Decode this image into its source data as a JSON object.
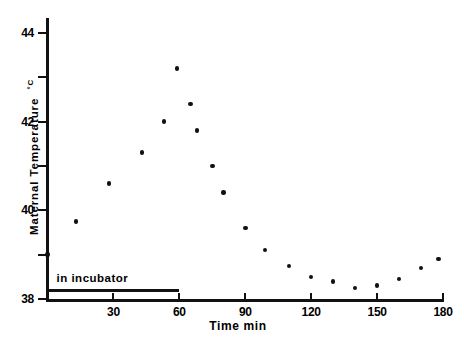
{
  "chart_data": {
    "type": "scatter",
    "title": "",
    "xlabel": "Time  min",
    "ylabel": "Maternal Temperature  °C",
    "ylabel_text": "Maternal Temperature",
    "ylabel_unit": "°C",
    "xlim": [
      0,
      180
    ],
    "ylim": [
      38,
      44
    ],
    "grid": false,
    "legend": null,
    "xticks": [
      0,
      30,
      60,
      90,
      120,
      150,
      180
    ],
    "xtick_labels": [
      "",
      "30",
      "60",
      "90",
      "120",
      "150",
      "180"
    ],
    "yticks": [
      38,
      39,
      40,
      41,
      42,
      43,
      44
    ],
    "ytick_labels": [
      "38",
      "",
      "40",
      "",
      "42",
      "",
      "44"
    ],
    "marker": "filled-circle",
    "marker_color": "#111111",
    "x": [
      0,
      13,
      28,
      43,
      53,
      59,
      65,
      68,
      75,
      80,
      90,
      99,
      110,
      120,
      130,
      140,
      150,
      160,
      170,
      178
    ],
    "y": [
      39.0,
      39.75,
      40.6,
      41.3,
      42.0,
      43.2,
      42.4,
      41.8,
      41.0,
      40.4,
      39.6,
      39.1,
      38.75,
      38.5,
      38.4,
      38.25,
      38.3,
      38.45,
      38.7,
      38.9
    ],
    "points": [
      {
        "x": 0,
        "y": 39.0
      },
      {
        "x": 13,
        "y": 39.75
      },
      {
        "x": 28,
        "y": 40.6
      },
      {
        "x": 43,
        "y": 41.3
      },
      {
        "x": 53,
        "y": 42.0
      },
      {
        "x": 59,
        "y": 43.2
      },
      {
        "x": 65,
        "y": 42.4
      },
      {
        "x": 68,
        "y": 41.8
      },
      {
        "x": 75,
        "y": 41.0
      },
      {
        "x": 80,
        "y": 40.4
      },
      {
        "x": 90,
        "y": 39.6
      },
      {
        "x": 99,
        "y": 39.1
      },
      {
        "x": 110,
        "y": 38.75
      },
      {
        "x": 120,
        "y": 38.5
      },
      {
        "x": 130,
        "y": 38.4
      },
      {
        "x": 140,
        "y": 38.25
      },
      {
        "x": 150,
        "y": 38.3
      },
      {
        "x": 160,
        "y": 38.45
      },
      {
        "x": 170,
        "y": 38.7
      },
      {
        "x": 178,
        "y": 38.9
      }
    ],
    "annotations": [
      {
        "name": "in-incubator",
        "label": "in  incubator",
        "type": "span-bar",
        "x_start": 0,
        "x_end": 60,
        "y": 38.2
      }
    ],
    "colors": {
      "ink": "#111111",
      "background": "#ffffff"
    }
  }
}
